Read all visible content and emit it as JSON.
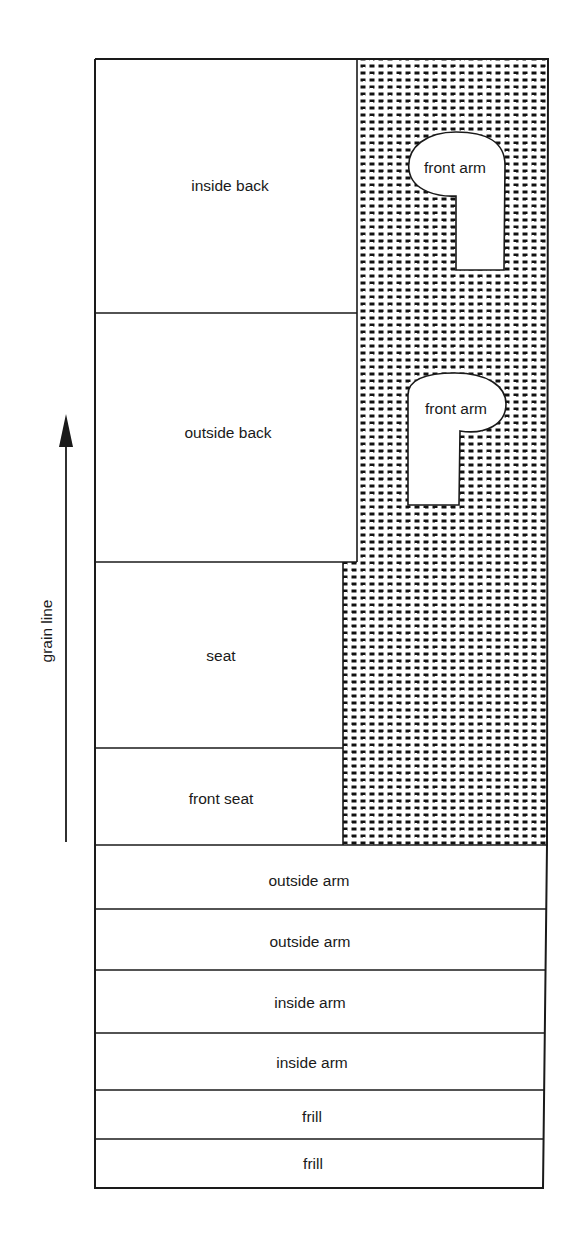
{
  "diagram": {
    "type": "fabric cutting layout",
    "colors": {
      "line": "#1a1a1a",
      "background": "#ffffff",
      "waste_dots": "#111111"
    },
    "grain_line": {
      "label": "grain line",
      "direction": "up"
    },
    "pieces": {
      "inside_back": "inside back",
      "outside_back": "outside back",
      "seat": "seat",
      "front_seat": "front seat",
      "front_arm_1": "front arm",
      "front_arm_2": "front arm",
      "outside_arm_1": "outside arm",
      "outside_arm_2": "outside arm",
      "inside_arm_1": "inside arm",
      "inside_arm_2": "inside arm",
      "frill_1": "frill",
      "frill_2": "frill"
    },
    "waste_area": {
      "pattern": "dotted / stippled",
      "description": "fabric waste region"
    }
  }
}
